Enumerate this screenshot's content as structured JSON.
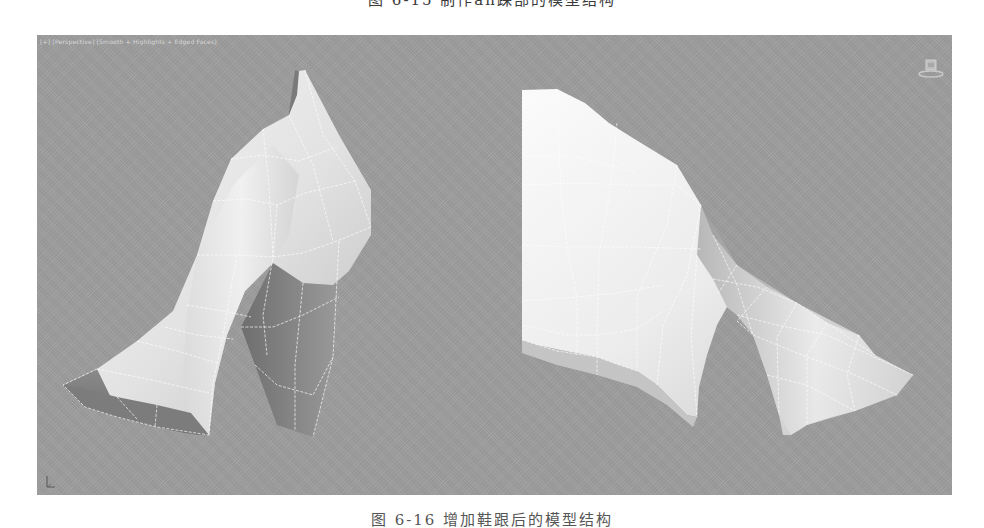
{
  "figure": {
    "top_caption": "图 6-15  制作an踝部的模型结构",
    "bottom_caption": "图 6-16  增加鞋跟后的模型结构"
  },
  "viewport": {
    "label": "[+] [Perspective] [Smooth + Highlights + Edged Faces]",
    "background_color": "#9e9e9e",
    "shading_mode": "Smooth + Highlights + Edged Faces",
    "view": "Perspective"
  },
  "icons": {
    "viewcube": "viewcube-icon",
    "axis_tripod": "axis-tripod-icon"
  },
  "models": [
    {
      "name": "shoe-model-left",
      "view": "three-quarter front"
    },
    {
      "name": "shoe-model-right",
      "view": "side"
    }
  ],
  "colors": {
    "mesh_light": "#f4f4f4",
    "mesh_mid": "#cfcfcf",
    "mesh_dark": "#6e6e6e",
    "wire": "#ffffff"
  }
}
